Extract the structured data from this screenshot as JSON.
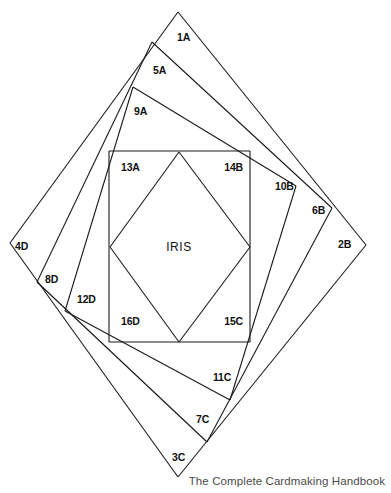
{
  "document": {
    "title": "Iris Folding Pattern",
    "caption": "The Complete Cardmaking Handbook",
    "center_label": "IRIS"
  },
  "chart_data": {
    "type": "diagram",
    "subtype": "iris-folding-pattern",
    "center_label": "IRIS",
    "caption": "The Complete Cardmaking Handbook",
    "canvas": {
      "width": 391,
      "height": 493
    },
    "background_color": "#ffffff",
    "stroke_color": "#1a1a1a",
    "outer_shape": {
      "name": "outer-diamond",
      "points": "178,12 366,245 178,477 10,243"
    },
    "inner_square": {
      "name": "iris-square",
      "x": 109,
      "y": 151,
      "width": 141,
      "height": 191,
      "points": "109,151 250,151 250,342 109,342"
    },
    "inner_diamond": {
      "name": "iris-diamond",
      "points": "179,152 250,247 179,342 110,247"
    },
    "spiral_vertices": [
      {
        "name": "v-1A",
        "x": 178,
        "y": 12
      },
      {
        "name": "v-5A",
        "x": 152,
        "y": 42
      },
      {
        "name": "v-9A",
        "x": 133,
        "y": 87
      },
      {
        "name": "v-2B",
        "x": 366,
        "y": 245
      },
      {
        "name": "v-6B",
        "x": 332,
        "y": 208
      },
      {
        "name": "v-10B",
        "x": 296,
        "y": 186
      },
      {
        "name": "v-3C",
        "x": 178,
        "y": 477
      },
      {
        "name": "v-7C",
        "x": 207,
        "y": 442
      },
      {
        "name": "v-11C",
        "x": 230,
        "y": 400
      },
      {
        "name": "v-4D",
        "x": 10,
        "y": 243
      },
      {
        "name": "v-8D",
        "x": 37,
        "y": 282
      },
      {
        "name": "v-12D",
        "x": 65,
        "y": 311
      }
    ],
    "segments": [
      {
        "name": "seg-1A-2B",
        "from": [
          178,
          12
        ],
        "to": [
          366,
          245
        ]
      },
      {
        "name": "seg-1A-4D",
        "from": [
          178,
          12
        ],
        "to": [
          10,
          243
        ]
      },
      {
        "name": "seg-2B-3C",
        "from": [
          366,
          245
        ],
        "to": [
          178,
          477
        ]
      },
      {
        "name": "seg-3C-4D",
        "from": [
          178,
          477
        ],
        "to": [
          10,
          243
        ]
      },
      {
        "name": "seg-5A-6B",
        "from": [
          152,
          42
        ],
        "to": [
          332,
          208
        ]
      },
      {
        "name": "seg-5A-8D",
        "from": [
          152,
          42
        ],
        "to": [
          37,
          282
        ]
      },
      {
        "name": "seg-6B-7C",
        "from": [
          332,
          208
        ],
        "to": [
          207,
          442
        ]
      },
      {
        "name": "seg-7C-8D",
        "from": [
          207,
          442
        ],
        "to": [
          37,
          282
        ]
      },
      {
        "name": "seg-9A-10B",
        "from": [
          133,
          87
        ],
        "to": [
          296,
          186
        ]
      },
      {
        "name": "seg-9A-12D",
        "from": [
          133,
          87
        ],
        "to": [
          65,
          311
        ]
      },
      {
        "name": "seg-10B-11C",
        "from": [
          296,
          186
        ],
        "to": [
          230,
          400
        ]
      },
      {
        "name": "seg-11C-12D",
        "from": [
          230,
          400
        ],
        "to": [
          65,
          311
        ]
      },
      {
        "name": "seg-13A-14B",
        "from": [
          109,
          151
        ],
        "to": [
          250,
          151
        ]
      },
      {
        "name": "seg-14B-15C",
        "from": [
          250,
          151
        ],
        "to": [
          250,
          342
        ]
      },
      {
        "name": "seg-15C-16D",
        "from": [
          250,
          342
        ],
        "to": [
          109,
          342
        ]
      },
      {
        "name": "seg-16D-13A",
        "from": [
          109,
          342
        ],
        "to": [
          109,
          151
        ]
      },
      {
        "name": "seg-diamond-tl",
        "from": [
          179,
          152
        ],
        "to": [
          110,
          247
        ]
      },
      {
        "name": "seg-diamond-tr",
        "from": [
          179,
          152
        ],
        "to": [
          250,
          247
        ]
      },
      {
        "name": "seg-diamond-bl",
        "from": [
          110,
          247
        ],
        "to": [
          179,
          342
        ]
      },
      {
        "name": "seg-diamond-br",
        "from": [
          250,
          247
        ],
        "to": [
          179,
          342
        ]
      }
    ],
    "labels": [
      {
        "id": "1A",
        "text": "1A",
        "x": 177,
        "y": 41,
        "anchor": "start"
      },
      {
        "id": "5A",
        "text": "5A",
        "x": 153,
        "y": 74,
        "anchor": "start"
      },
      {
        "id": "9A",
        "text": "9A",
        "x": 134,
        "y": 115,
        "anchor": "start"
      },
      {
        "id": "13A",
        "text": "13A",
        "x": 121,
        "y": 171,
        "anchor": "start"
      },
      {
        "id": "14B",
        "text": "14B",
        "x": 243,
        "y": 171,
        "anchor": "end"
      },
      {
        "id": "10B",
        "text": "10B",
        "x": 275,
        "y": 190,
        "anchor": "start"
      },
      {
        "id": "6B",
        "text": "6B",
        "x": 312,
        "y": 214,
        "anchor": "start"
      },
      {
        "id": "2B",
        "text": "2B",
        "x": 338,
        "y": 248,
        "anchor": "start"
      },
      {
        "id": "15C",
        "text": "15C",
        "x": 243,
        "y": 325,
        "anchor": "end"
      },
      {
        "id": "11C",
        "text": "11C",
        "x": 213,
        "y": 381,
        "anchor": "start"
      },
      {
        "id": "7C",
        "text": "7C",
        "x": 196,
        "y": 423,
        "anchor": "start"
      },
      {
        "id": "3C",
        "text": "3C",
        "x": 172,
        "y": 461,
        "anchor": "start"
      },
      {
        "id": "16D",
        "text": "16D",
        "x": 121,
        "y": 325,
        "anchor": "start"
      },
      {
        "id": "12D",
        "text": "12D",
        "x": 77,
        "y": 303,
        "anchor": "start"
      },
      {
        "id": "8D",
        "text": "8D",
        "x": 45,
        "y": 283,
        "anchor": "start"
      },
      {
        "id": "4D",
        "text": "4D",
        "x": 15,
        "y": 250,
        "anchor": "start"
      }
    ],
    "center_text": {
      "text": "IRIS",
      "x": 179,
      "y": 251
    }
  }
}
